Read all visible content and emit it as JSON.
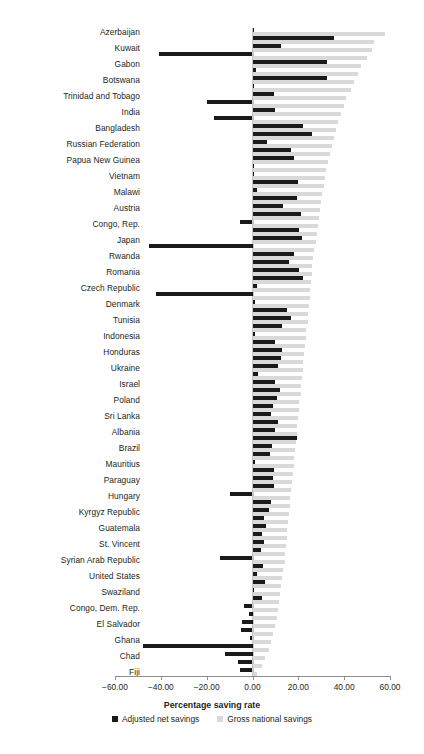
{
  "chart_data": {
    "type": "bar",
    "orientation": "horizontal",
    "title": "",
    "xlabel": "Percentage saving rate",
    "ylabel": "",
    "xlim": [
      -60,
      60
    ],
    "xticks": [
      "-60.00",
      "-40.00",
      "-20.00",
      "0.00",
      "20.00",
      "40.00",
      "60.00"
    ],
    "xtick_values": [
      -60,
      -40,
      -20,
      0,
      20,
      40,
      60
    ],
    "grid": false,
    "legend_position": "bottom",
    "legend": [
      "Adjusted net savings",
      "Gross national savings"
    ],
    "colors": {
      "adjusted_net_savings": "#1a1a1a",
      "gross_national_savings": "#d9d9d9",
      "axis": "#8c8c8c",
      "text": "#231f20"
    },
    "series": [
      {
        "name": "Adjusted net savings",
        "key": "anet"
      },
      {
        "name": "Gross national savings",
        "key": "gns"
      }
    ],
    "categories": [
      "Azerbaijan",
      "",
      "Kuwait",
      "",
      "Gabon",
      "",
      "Botswana",
      "",
      "Trinidad and Tobago",
      "",
      "India",
      "",
      "Bangladesh",
      "",
      "Russian Federation",
      "",
      "Papua New Guinea",
      "",
      "Vietnam",
      "",
      "Malawi",
      "",
      "Austria",
      "",
      "Congo, Rep.",
      "",
      "Japan",
      "",
      "Rwanda",
      "",
      "Romania",
      "",
      "Czech Republic",
      "",
      "Denmark",
      "",
      "Tunisia",
      "",
      "Indonesia",
      "",
      "Honduras",
      "",
      "Ukraine",
      "",
      "Israel",
      "",
      "Poland",
      "",
      "Sri Lanka",
      "",
      "Albania",
      "",
      "Brazil",
      "",
      "Mauritius",
      "",
      "Paraguay",
      "",
      "Hungary",
      "",
      "Kyrgyz Republic",
      "",
      "Guatemala",
      "",
      "St. Vincent",
      "",
      "Syrian Arab Republic",
      "",
      "United States",
      "",
      "Swaziland",
      "",
      "Congo, Dem. Rep.",
      "",
      "El Salvador",
      "",
      "Ghana",
      "",
      "Chad",
      "",
      "Fiji"
    ],
    "labels_shown": [
      "Azerbaijan",
      "Kuwait",
      "Gabon",
      "Botswana",
      "Trinidad and Tobago",
      "India",
      "Bangladesh",
      "Russian Federation",
      "Papua New Guinea",
      "Vietnam",
      "Malawi",
      "Austria",
      "Congo, Rep.",
      "Japan",
      "Rwanda",
      "Romania",
      "Czech Republic",
      "Denmark",
      "Tunisia",
      "Indonesia",
      "Honduras",
      "Ukraine",
      "Israel",
      "Poland",
      "Sri Lanka",
      "Albania",
      "Brazil",
      "Mauritius",
      "Paraguay",
      "Hungary",
      "Kyrgyz Republic",
      "Guatemala",
      "St. Vincent",
      "Syrian Arab Republic",
      "United States",
      "Swaziland",
      "Congo, Dem. Rep.",
      "El Salvador",
      "Ghana",
      "Chad",
      "Fiji"
    ],
    "rows": [
      {
        "label": "Azerbaijan",
        "anet": 0.3,
        "gns": 58.0
      },
      {
        "label": "",
        "anet": 35.5,
        "gns": 53.0
      },
      {
        "label": "Kuwait",
        "anet": 12.5,
        "gns": 52.0
      },
      {
        "label": "",
        "anet": -41.0,
        "gns": 50.0
      },
      {
        "label": "Gabon",
        "anet": 32.5,
        "gns": 47.5
      },
      {
        "label": "",
        "anet": 1.5,
        "gns": 46.0
      },
      {
        "label": "Botswana",
        "anet": 32.5,
        "gns": 44.5
      },
      {
        "label": "",
        "anet": 0.8,
        "gns": 43.0
      },
      {
        "label": "Trinidad and Tobago",
        "anet": 9.5,
        "gns": 41.0
      },
      {
        "label": "",
        "anet": -20.0,
        "gns": 40.0
      },
      {
        "label": "India",
        "anet": 10.0,
        "gns": 38.5
      },
      {
        "label": "",
        "anet": -17.0,
        "gns": 37.5
      },
      {
        "label": "Bangladesh",
        "anet": 22.0,
        "gns": 36.5
      },
      {
        "label": "",
        "anet": 26.0,
        "gns": 35.5
      },
      {
        "label": "Russian Federation",
        "anet": 6.5,
        "gns": 34.5
      },
      {
        "label": "",
        "anet": 17.0,
        "gns": 34.0
      },
      {
        "label": "Papua New Guinea",
        "anet": 18.0,
        "gns": 33.0
      },
      {
        "label": "",
        "anet": 0.5,
        "gns": 32.0
      },
      {
        "label": "Vietnam",
        "anet": 0.2,
        "gns": 31.5
      },
      {
        "label": "",
        "anet": 20.0,
        "gns": 31.0
      },
      {
        "label": "Malawi",
        "anet": 2.0,
        "gns": 30.5
      },
      {
        "label": "",
        "anet": 19.5,
        "gns": 30.0
      },
      {
        "label": "Austria",
        "anet": 13.5,
        "gns": 29.5
      },
      {
        "label": "",
        "anet": 21.0,
        "gns": 29.0
      },
      {
        "label": "Congo, Rep.",
        "anet": -5.5,
        "gns": 28.5
      },
      {
        "label": "",
        "anet": 20.5,
        "gns": 28.0
      },
      {
        "label": "Japan",
        "anet": 21.5,
        "gns": 27.5
      },
      {
        "label": "",
        "anet": -45.0,
        "gns": 27.0
      },
      {
        "label": "Rwanda",
        "anet": 18.0,
        "gns": 26.5
      },
      {
        "label": "",
        "anet": 16.0,
        "gns": 26.0
      },
      {
        "label": "Romania",
        "anet": 20.5,
        "gns": 25.8
      },
      {
        "label": "",
        "anet": 22.0,
        "gns": 25.5
      },
      {
        "label": "Czech Republic",
        "anet": 2.0,
        "gns": 25.2
      },
      {
        "label": "",
        "anet": -42.0,
        "gns": 25.0
      },
      {
        "label": "Denmark",
        "anet": 1.0,
        "gns": 24.5
      },
      {
        "label": "",
        "anet": 15.0,
        "gns": 24.2
      },
      {
        "label": "Tunisia",
        "anet": 17.0,
        "gns": 24.0
      },
      {
        "label": "",
        "anet": 13.0,
        "gns": 23.5
      },
      {
        "label": "Indonesia",
        "anet": 1.2,
        "gns": 23.2
      },
      {
        "label": "",
        "anet": 10.0,
        "gns": 23.0
      },
      {
        "label": "Honduras",
        "anet": 13.0,
        "gns": 22.5
      },
      {
        "label": "",
        "anet": 12.5,
        "gns": 22.2
      },
      {
        "label": "Ukraine",
        "anet": 11.0,
        "gns": 22.0
      },
      {
        "label": "",
        "anet": 2.5,
        "gns": 21.5
      },
      {
        "label": "Israel",
        "anet": 10.0,
        "gns": 21.2
      },
      {
        "label": "",
        "anet": 12.0,
        "gns": 21.0
      },
      {
        "label": "Poland",
        "anet": 10.5,
        "gns": 20.5
      },
      {
        "label": "",
        "anet": 9.0,
        "gns": 20.2
      },
      {
        "label": "Sri Lanka",
        "anet": 8.0,
        "gns": 20.0
      },
      {
        "label": "",
        "anet": 11.0,
        "gns": 19.5
      },
      {
        "label": "Albania",
        "anet": 10.0,
        "gns": 19.2
      },
      {
        "label": "",
        "anet": 19.5,
        "gns": 19.0
      },
      {
        "label": "Brazil",
        "anet": 8.5,
        "gns": 18.5
      },
      {
        "label": "",
        "anet": 7.5,
        "gns": 18.2
      },
      {
        "label": "Mauritius",
        "anet": 1.0,
        "gns": 18.0
      },
      {
        "label": "",
        "anet": 9.5,
        "gns": 17.5
      },
      {
        "label": "Paraguay",
        "anet": 9.0,
        "gns": 17.2
      },
      {
        "label": "",
        "anet": 9.5,
        "gns": 17.0
      },
      {
        "label": "Hungary",
        "anet": -10.0,
        "gns": 16.5
      },
      {
        "label": "",
        "anet": 8.0,
        "gns": 16.2
      },
      {
        "label": "Kyrgyz Republic",
        "anet": 7.0,
        "gns": 16.0
      },
      {
        "label": "",
        "anet": 5.0,
        "gns": 15.5
      },
      {
        "label": "Guatemala",
        "anet": 6.0,
        "gns": 15.2
      },
      {
        "label": "",
        "anet": 4.0,
        "gns": 15.0
      },
      {
        "label": "St. Vincent",
        "anet": 5.0,
        "gns": 14.5
      },
      {
        "label": "",
        "anet": 3.5,
        "gns": 14.2
      },
      {
        "label": "Syrian Arab Republic",
        "anet": -14.0,
        "gns": 14.0
      },
      {
        "label": "",
        "anet": 4.5,
        "gns": 13.5
      },
      {
        "label": "United States",
        "anet": 2.0,
        "gns": 13.0
      },
      {
        "label": "",
        "anet": 5.5,
        "gns": 12.5
      },
      {
        "label": "Swaziland",
        "anet": 0.8,
        "gns": 12.0
      },
      {
        "label": "",
        "anet": 4.0,
        "gns": 11.5
      },
      {
        "label": "Congo, Dem. Rep.",
        "anet": -3.5,
        "gns": 11.0
      },
      {
        "label": "",
        "anet": -1.5,
        "gns": 10.5
      },
      {
        "label": "El Salvador",
        "anet": -4.5,
        "gns": 10.0
      },
      {
        "label": "",
        "anet": -5.0,
        "gns": 9.0
      },
      {
        "label": "Ghana",
        "anet": -1.0,
        "gns": 8.0
      },
      {
        "label": "",
        "anet": -48.0,
        "gns": 7.0
      },
      {
        "label": "Chad",
        "anet": -12.0,
        "gns": 5.5
      },
      {
        "label": "",
        "anet": -6.5,
        "gns": 4.0
      },
      {
        "label": "Fiji",
        "anet": -5.5,
        "gns": 2.0
      }
    ]
  },
  "axis": {
    "xlabel": "Percentage saving rate"
  },
  "legend": {
    "items": [
      {
        "label": "Adjusted net savings",
        "swatch": "adjusted-net-savings-swatch"
      },
      {
        "label": "Gross national savings",
        "swatch": "gross-national-savings-swatch"
      }
    ]
  }
}
